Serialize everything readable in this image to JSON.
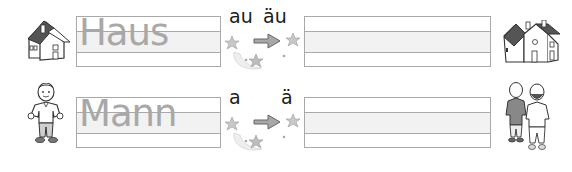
{
  "worksheet": {
    "rows": [
      {
        "word": "Haus",
        "vowel_from": "au",
        "vowel_to": "äu",
        "left_image": "house-icon",
        "right_image": "houses-icon"
      },
      {
        "word": "Mann",
        "vowel_from": "a",
        "vowel_to": "ä",
        "left_image": "man-icon",
        "right_image": "men-icon"
      }
    ]
  },
  "colors": {
    "line": "#a9a9a9",
    "band": "#f2f2f2",
    "model_text": "#a8a8a8",
    "vowel_text": "#1a1a1a",
    "arrow": "#9a9a9a"
  }
}
